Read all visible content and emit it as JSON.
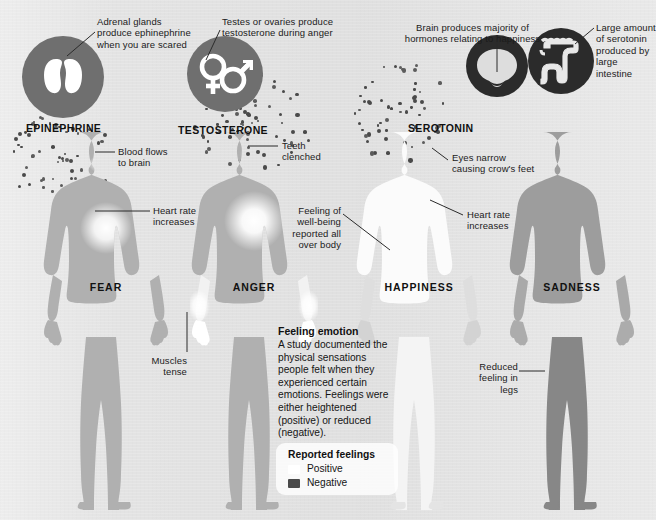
{
  "meta": {
    "background_color": "#e3e3e3",
    "body_base_color": "#b0b0b0",
    "body_sad_color": "#8f8f8f",
    "icon_circle_color": "#6f6f6f",
    "icon_circle_dark_color": "#2b2b2b",
    "positive_color": "#ffffff",
    "negative_color": "#4a4a4a",
    "dot_color": "#4a4a4a",
    "leader_color": "#2b2b2b"
  },
  "hormones": [
    {
      "id": "epinephrine",
      "label": "EPINEPHRINE",
      "icon_name": "adrenal-glands-icon",
      "caption": "Adrenal glands\nproduce ephinephrine\nwhen you are scared"
    },
    {
      "id": "testosterone",
      "label": "TESTOSTERONE",
      "icon_name": "gender-symbols-icon",
      "caption": "Testes or ovaries produce\ntestosterone during anger"
    },
    {
      "id": "serotonin",
      "label": "SEROTONIN",
      "icon_name": "brain-icon",
      "caption": "Brain produces majority of\nhormones relating to happiness"
    },
    {
      "id": "serotonin_gut",
      "label": "",
      "icon_name": "large-intestine-icon",
      "caption": "Large amount\nof serotonin\nproduced by\nlarge intestine"
    }
  ],
  "bodies": [
    {
      "id": "fear",
      "emotion_label": "FEAR"
    },
    {
      "id": "anger",
      "emotion_label": "ANGER"
    },
    {
      "id": "happiness",
      "emotion_label": "HAPPINESS"
    },
    {
      "id": "sadness",
      "emotion_label": "SADNESS"
    }
  ],
  "annotations": [
    {
      "id": "blood-flows-to-brain",
      "text": "Blood flows\nto brain"
    },
    {
      "id": "heart-rate-fear",
      "text": "Heart rate\nincreases"
    },
    {
      "id": "teeth-clenched",
      "text": "Teeth\nclenched"
    },
    {
      "id": "muscles-tense",
      "text": "Muscles\ntense"
    },
    {
      "id": "eyes-narrow",
      "text": "Eyes narrow\ncausing crow's feet"
    },
    {
      "id": "heart-rate-happiness",
      "text": "Heart rate\nincreases"
    },
    {
      "id": "well-being",
      "text": "Feeling of\nwell-being\nreported all\nover body"
    },
    {
      "id": "reduced-legs",
      "text": "Reduced\nfeeling in\nlegs"
    }
  ],
  "info": {
    "title": "Feeling emotion",
    "body": "A study documented the physical sensations people felt when they experienced certain emotions. Feelings were either heightened (positive) or reduced (negative)."
  },
  "legend": {
    "title": "Reported feelings",
    "items": [
      {
        "label": "Positive",
        "color": "#ffffff"
      },
      {
        "label": "Negative",
        "color": "#4a4a4a"
      }
    ]
  }
}
